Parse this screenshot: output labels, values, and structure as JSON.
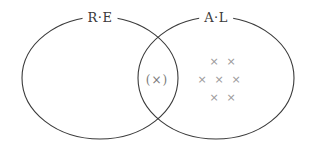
{
  "diagram": {
    "type": "venn",
    "stroke_color": "#3a3a3a",
    "mark_color": "#9a9a9a",
    "sets": [
      {
        "id": "left",
        "label": "R·E",
        "cx": 100,
        "cy": 78,
        "rx": 78,
        "ry": 61,
        "label_x": 100,
        "label_y": 18
      },
      {
        "id": "right",
        "label": "A·L",
        "cx": 216,
        "cy": 78,
        "rx": 78,
        "ry": 61,
        "label_x": 216,
        "label_y": 18
      }
    ],
    "intersection": {
      "mark": "(×)",
      "x": 157,
      "y": 80
    },
    "right_only_marks": [
      {
        "symbol": "×",
        "x": 214,
        "y": 62
      },
      {
        "symbol": "×",
        "x": 231,
        "y": 62
      },
      {
        "symbol": "×",
        "x": 202,
        "y": 80
      },
      {
        "symbol": "×",
        "x": 219,
        "y": 80
      },
      {
        "symbol": "×",
        "x": 236,
        "y": 80
      },
      {
        "symbol": "×",
        "x": 214,
        "y": 98
      },
      {
        "symbol": "×",
        "x": 231,
        "y": 98
      }
    ],
    "left_only_marks": []
  }
}
